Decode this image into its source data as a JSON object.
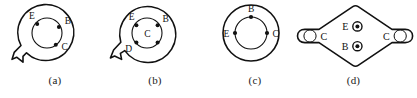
{
  "sheet": {
    "title": "Transistor package terminal identification diagrams",
    "background_color": "#ffffff",
    "line_color": "#111111",
    "width": 417,
    "height": 98
  },
  "figures": [
    {
      "id": "a",
      "caption": "(a)",
      "package_style": "round-can-with-tab",
      "tab_position": "lower-left",
      "has_center_label": false,
      "leads": [
        {
          "label": "E",
          "position": "upper-left",
          "marker": "dot"
        },
        {
          "label": "B",
          "position": "right-upper",
          "marker": "dot"
        },
        {
          "label": "C",
          "position": "lower-right",
          "marker": "dot"
        }
      ],
      "unlabeled_lead_count": 0
    },
    {
      "id": "b",
      "caption": "(b)",
      "package_style": "round-can-with-tab",
      "tab_position": "left",
      "has_center_label": true,
      "center_label": "C",
      "leads": [
        {
          "label": "E",
          "position": "upper-left",
          "marker": "dot"
        },
        {
          "label": "B",
          "position": "upper-right",
          "marker": "dot"
        },
        {
          "label": "D",
          "position": "lower-left",
          "marker": "dot"
        },
        {
          "label": "",
          "position": "lower-right",
          "marker": "dot"
        }
      ],
      "unlabeled_lead_count": 1
    },
    {
      "id": "c",
      "caption": "(c)",
      "package_style": "round-can-plain",
      "tab_position": "none",
      "has_center_label": false,
      "leads": [
        {
          "label": "B",
          "position": "top",
          "marker": "dot"
        },
        {
          "label": "E",
          "position": "left",
          "marker": "dot"
        },
        {
          "label": "C",
          "position": "right",
          "marker": "dot"
        }
      ],
      "unlabeled_lead_count": 0
    },
    {
      "id": "d",
      "caption": "(d)",
      "package_style": "diamond-power-package",
      "tab_position": "none",
      "has_center_label": false,
      "leads": [
        {
          "label": "C",
          "position": "left-mounting-hole",
          "marker": "open-circle"
        },
        {
          "label": "C",
          "position": "right-mounting-hole",
          "marker": "open-circle"
        },
        {
          "label": "E",
          "position": "center-upper",
          "marker": "ringed-dot"
        },
        {
          "label": "B",
          "position": "center-lower",
          "marker": "ringed-dot"
        }
      ],
      "unlabeled_lead_count": 0
    }
  ]
}
